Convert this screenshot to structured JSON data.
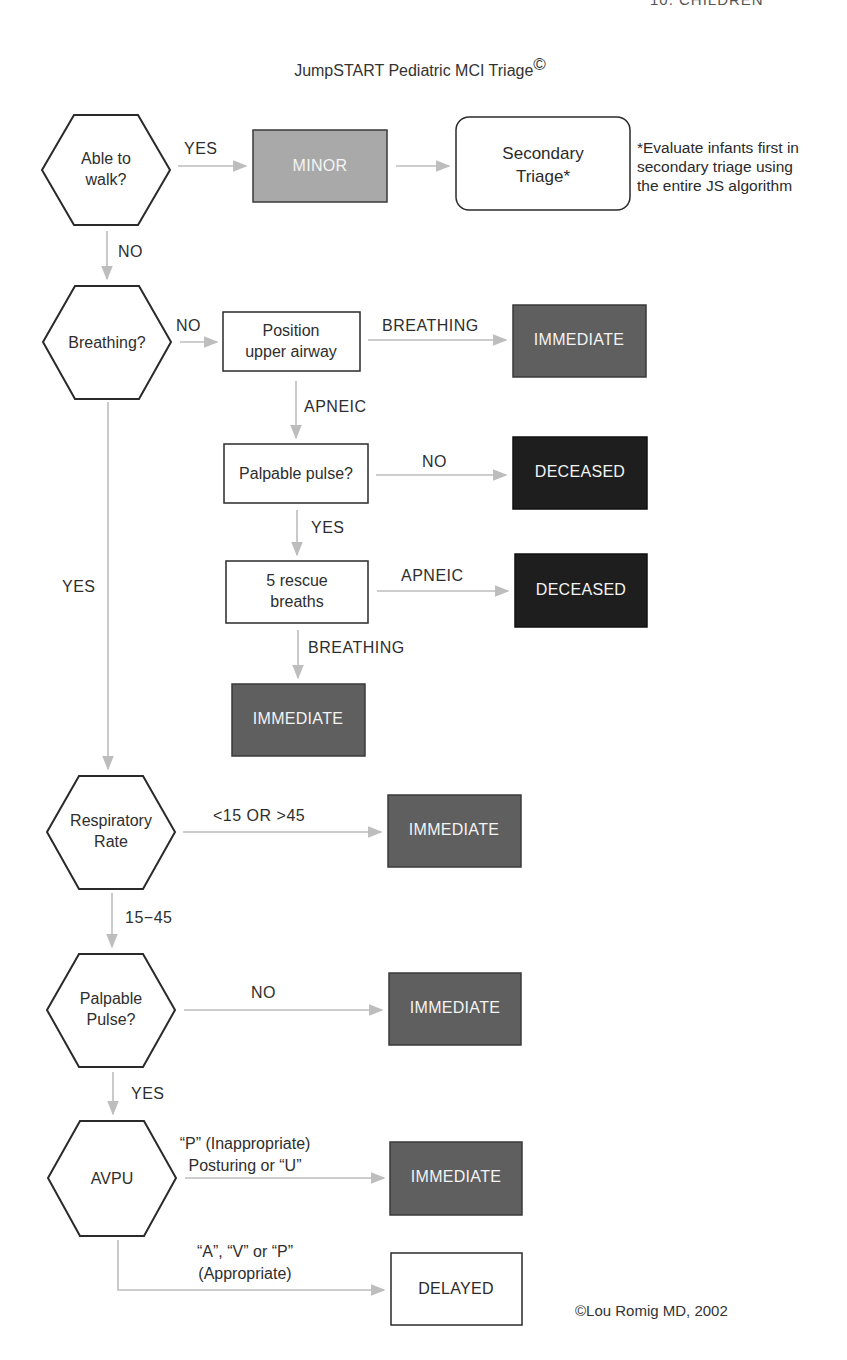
{
  "header": {
    "top_right_cutoff": "10. CHILDREN"
  },
  "title": "JumpSTART Pediatric MCI Triage",
  "title_mark": "©",
  "colors": {
    "minor": "#a9a9a9",
    "immediate": "#5f5f5f",
    "deceased": "#1e1e1e",
    "delayed": "#ffffff",
    "arrow": "#bdbdbd",
    "outline": "#2a2a2a"
  },
  "decisions": {
    "walk": [
      "Able to",
      "walk?"
    ],
    "breathing": [
      "Breathing?"
    ],
    "resp_rate": [
      "Respiratory",
      "Rate"
    ],
    "pulse": [
      "Palpable",
      "Pulse?"
    ],
    "avpu": [
      "AVPU"
    ]
  },
  "steps": {
    "airway": [
      "Position",
      "upper airway"
    ],
    "palpable_pulse": "Palpable pulse?",
    "rescue": [
      "5 rescue",
      "breaths"
    ],
    "secondary": [
      "Secondary",
      "Triage*"
    ]
  },
  "outcomes": {
    "minor": "MINOR",
    "immediate": "IMMEDIATE",
    "deceased": "DECEASED",
    "delayed": "DELAYED"
  },
  "edges": {
    "walk_yes": "YES",
    "walk_no": "NO",
    "breathing_no": "NO",
    "airway_breathing": "BREATHING",
    "airway_apneic": "APNEIC",
    "pulse_no": "NO",
    "pulse_yes": "YES",
    "rescue_apneic": "APNEIC",
    "rescue_breathing": "BREATHING",
    "breathing_yes": "YES",
    "rr_abnormal": "<15 OR >45",
    "rr_normal": "15−45",
    "pp_no": "NO",
    "pp_yes": "YES",
    "avpu_immediate": [
      "“P” (Inappropriate)",
      "Posturing or “U”"
    ],
    "avpu_delayed": [
      "“A”, “V” or “P”",
      "(Appropriate)"
    ]
  },
  "note": [
    "*Evaluate infants first in",
    "secondary triage using",
    "the entire JS algorithm"
  ],
  "credit": "©Lou Romig MD, 2002"
}
